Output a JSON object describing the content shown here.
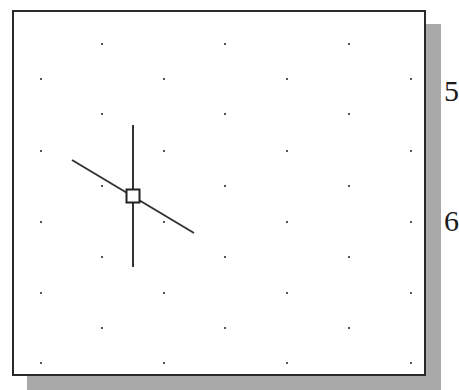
{
  "canvas": {
    "frame": {
      "x": 12,
      "y": 10,
      "width": 414,
      "height": 366,
      "border_color": "#2a2a2a",
      "background": "#ffffff"
    },
    "shadow": {
      "color": "#a9a9a9",
      "offset_x": 15,
      "offset_y": 14
    }
  },
  "grid": {
    "style": "isometric",
    "dot_color": "#555555",
    "odd_row_x": [
      102,
      225,
      349
    ],
    "even_row_x": [
      41,
      164,
      287,
      411
    ],
    "odd_row_y": [
      44,
      114,
      186,
      257,
      328
    ],
    "even_row_y": [
      79,
      151,
      222,
      293,
      363
    ]
  },
  "cursor": {
    "type": "isometric-crosshair",
    "color": "#333333",
    "center": {
      "x": 133,
      "y": 196
    },
    "pickbox_size": 13,
    "vertical_line": {
      "x": 133,
      "y1": 125,
      "y2": 267
    },
    "diagonal_line": {
      "x1": 72,
      "y1": 160,
      "x2": 194,
      "y2": 233
    }
  },
  "edge_text": [
    {
      "text": "5",
      "x": 444,
      "y": 76
    },
    {
      "text": "6",
      "x": 444,
      "y": 206
    }
  ]
}
